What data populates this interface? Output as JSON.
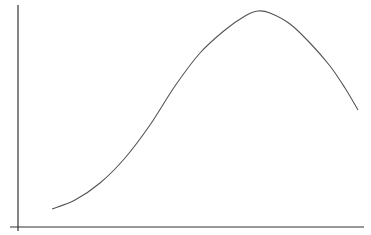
{
  "chart_data": {
    "type": "line",
    "title": "",
    "xlabel": "",
    "ylabel": "",
    "grid": false,
    "legend": null,
    "x_ticks": [],
    "y_ticks": [],
    "series": [
      {
        "name": "curve",
        "color": "#555555",
        "points_px": [
          [
            52,
            209
          ],
          [
            75,
            200
          ],
          [
            100,
            183
          ],
          [
            125,
            158
          ],
          [
            150,
            125
          ],
          [
            175,
            86
          ],
          [
            200,
            53
          ],
          [
            225,
            30
          ],
          [
            245,
            16
          ],
          [
            258,
            11
          ],
          [
            270,
            13
          ],
          [
            290,
            24
          ],
          [
            310,
            43
          ],
          [
            330,
            66
          ],
          [
            345,
            88
          ],
          [
            358,
            110
          ]
        ]
      }
    ],
    "axis_color": "#333333"
  }
}
